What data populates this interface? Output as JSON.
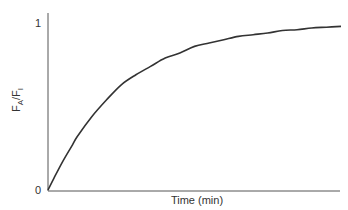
{
  "chart_data": {
    "type": "line",
    "title": "",
    "xlabel": "Time (min)",
    "ylabel": {
      "base1": "F",
      "sub1": "A",
      "sep": "/",
      "base2": "F",
      "sub2": "I"
    },
    "ylabel_text": "FA/FI",
    "xlim": [
      0,
      1
    ],
    "ylim": [
      0,
      1
    ],
    "yticks": [
      {
        "value": 0,
        "label": "0"
      },
      {
        "value": 1,
        "label": "1"
      }
    ],
    "xticks": [],
    "grid": false,
    "legend": "none",
    "series": [
      {
        "name": "FA/FI",
        "color": "#333333",
        "x": [
          0,
          0.02,
          0.05,
          0.08,
          0.1,
          0.15,
          0.2,
          0.25,
          0.3,
          0.35,
          0.4,
          0.45,
          0.5,
          0.55,
          0.6,
          0.65,
          0.7,
          0.75,
          0.8,
          0.85,
          0.9,
          0.95,
          1.0
        ],
        "y": [
          0,
          0.07,
          0.17,
          0.26,
          0.32,
          0.44,
          0.54,
          0.63,
          0.69,
          0.74,
          0.79,
          0.82,
          0.86,
          0.88,
          0.9,
          0.92,
          0.93,
          0.94,
          0.955,
          0.96,
          0.97,
          0.975,
          0.98
        ]
      }
    ]
  }
}
